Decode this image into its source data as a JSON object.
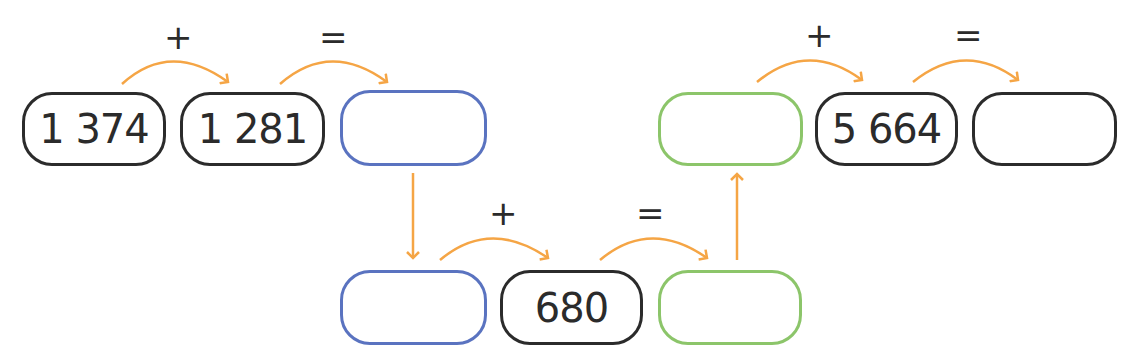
{
  "diagram": {
    "type": "addition chain",
    "colors": {
      "arrow": "#f5a545",
      "black_box": "#2b2b2b",
      "blue_box": "#5a73c0",
      "green_box": "#8cc56a"
    },
    "top_left": {
      "operand1": "1 374",
      "operand2": "1 281",
      "result": "",
      "plus": "+",
      "equals": "="
    },
    "bottom": {
      "operand1": "",
      "operand2": "680",
      "result": "",
      "plus": "+",
      "equals": "="
    },
    "top_right": {
      "operand1": "",
      "operand2": "5 664",
      "result": "",
      "plus": "+",
      "equals": "="
    }
  }
}
